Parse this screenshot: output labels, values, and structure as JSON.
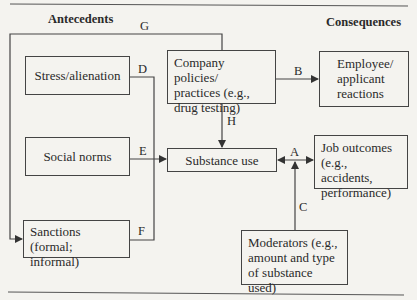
{
  "headers": {
    "antecedents": "Antecedents",
    "consequences": "Consequences"
  },
  "boxes": {
    "stress": "Stress/alienation",
    "company": [
      "Company policies/",
      "practices (e.g.,",
      "drug testing)"
    ],
    "employee": [
      "Employee/",
      "applicant",
      "reactions"
    ],
    "social": "Social norms",
    "substance": "Substance use",
    "job": [
      "Job outcomes",
      "(e.g., accidents,",
      "performance)"
    ],
    "sanctions": [
      "Sanctions",
      "(formal; informal)"
    ],
    "moderators": [
      "Moderators (e.g.,",
      "amount and type",
      "of substance used)"
    ]
  },
  "paths": {
    "A": "A",
    "B": "B",
    "C": "C",
    "D": "D",
    "E": "E",
    "F": "F",
    "G": "G",
    "H": "H"
  },
  "colors": {
    "line": "#444444",
    "background": "#f4f3ef"
  }
}
